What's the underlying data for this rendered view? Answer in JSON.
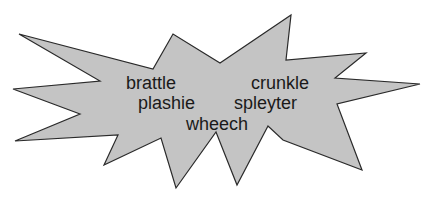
{
  "diagram": {
    "type": "starburst-callout",
    "fill_color": "#c4c4c4",
    "stroke_color": "#2a2a2a",
    "words": [
      {
        "id": "brattle",
        "text": "brattle"
      },
      {
        "id": "plashie",
        "text": "plashie"
      },
      {
        "id": "wheech",
        "text": "wheech"
      },
      {
        "id": "crunkle",
        "text": "crunkle"
      },
      {
        "id": "spleyter",
        "text": "spleyter"
      }
    ]
  }
}
